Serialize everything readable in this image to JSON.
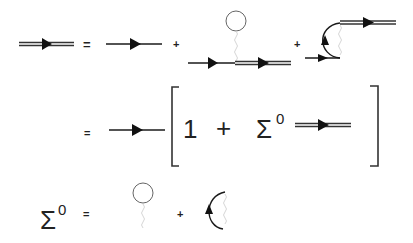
{
  "colors": {
    "line": "#1a1a1a",
    "double_line": "#333333",
    "circle": "#555555",
    "wavy": "#cfcfcf",
    "text": "#222222"
  },
  "row1": {
    "lhs": "full-propagator",
    "eq": "=",
    "term1": "bare-propagator",
    "plus1": "+",
    "term2": "hartree-tadpole-diagram",
    "plus2": "+",
    "term3": "fock-exchange-diagram"
  },
  "row2": {
    "eq": "=",
    "term_prefix": "bare-propagator",
    "bracket_left": "[",
    "one": "1",
    "plus": "+",
    "sigma": "Σ",
    "sigma_sup": "0",
    "term_suffix": "full-propagator",
    "bracket_right": "]"
  },
  "row3": {
    "sigma": "Σ",
    "sigma_sup": "0",
    "eq": "=",
    "term1": "hartree-loop",
    "plus": "+",
    "term2": "fock-arc"
  }
}
